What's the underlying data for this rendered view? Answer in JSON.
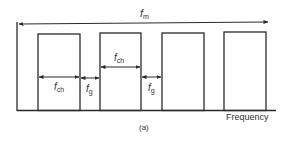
{
  "diagram": {
    "labels": {
      "total_bandwidth": "f",
      "total_bandwidth_sub": "m",
      "channel_width": "f",
      "channel_width_sub": "ch",
      "guard_band": "f",
      "guard_band_sub": "g",
      "x_axis": "Frequency",
      "caption": "(a)"
    },
    "channels": [
      {
        "x": 38,
        "width": 42
      },
      {
        "x": 100,
        "width": 41
      },
      {
        "x": 162,
        "width": 42
      },
      {
        "x": 224,
        "width": 42
      }
    ],
    "line_color": "#2a2a2a"
  }
}
